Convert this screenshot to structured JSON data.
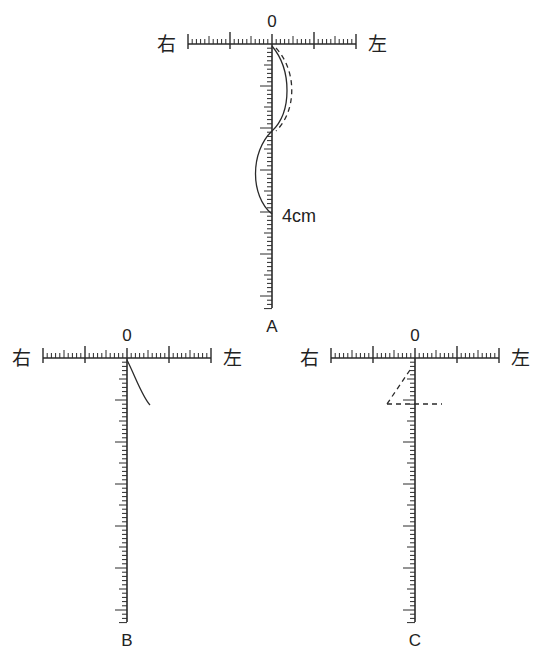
{
  "figure": {
    "panels": [
      {
        "id": "A",
        "label": "A",
        "zero_label": "0",
        "right_label": "右",
        "left_label": "左",
        "unit_annotation": "4cm",
        "origin": [
          272,
          44
        ],
        "h_half_len": 84,
        "v_len": 264,
        "curves": [
          {
            "style": "solid",
            "path": "M272,46 C292,70 292,112 272,131"
          },
          {
            "style": "dashed",
            "path": "M276,48 C298,72 296,112 276,131"
          },
          {
            "style": "solid",
            "path": "M272,131 C250,152 250,196 272,214"
          }
        ]
      },
      {
        "id": "B",
        "label": "B",
        "zero_label": "0",
        "right_label": "右",
        "left_label": "左",
        "unit_annotation": "",
        "origin": [
          127,
          358
        ],
        "h_half_len": 84,
        "v_len": 264,
        "curves": [
          {
            "style": "solid",
            "path": "M127,360 C136,378 142,396 150,405"
          }
        ]
      },
      {
        "id": "C",
        "label": "C",
        "zero_label": "0",
        "right_label": "右",
        "left_label": "左",
        "unit_annotation": "",
        "origin": [
          415,
          358
        ],
        "h_half_len": 84,
        "v_len": 264,
        "curves": [
          {
            "style": "dashed",
            "path": "M410,370 L387,404"
          },
          {
            "style": "dashed",
            "path": "M387,404 L442,404"
          }
        ]
      }
    ],
    "scale": {
      "minor_tick_spacing_px": 4.2,
      "major_every": 10,
      "mid_every": 5,
      "unit": "cm"
    }
  }
}
